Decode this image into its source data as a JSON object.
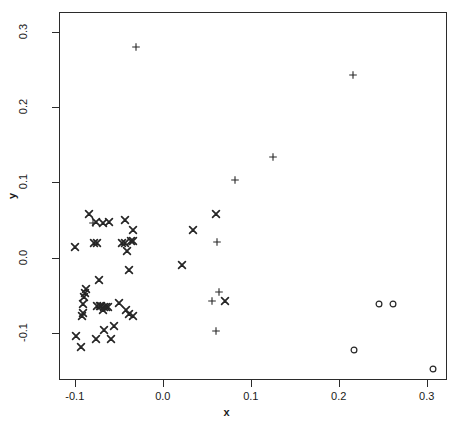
{
  "chart_data": {
    "type": "scatter",
    "title": "",
    "xlabel": "x",
    "ylabel": "y",
    "xlim": [
      -0.118,
      0.323
    ],
    "ylim": [
      -0.163,
      0.327
    ],
    "grid": false,
    "legend": "none",
    "xticks": [
      -0.1,
      0.0,
      0.1,
      0.2,
      0.3
    ],
    "xticklabels": [
      "-0.1",
      "0.0",
      "0.1",
      "0.2",
      "0.3"
    ],
    "yticks": [
      -0.1,
      0.0,
      0.1,
      0.2,
      0.3
    ],
    "yticklabels": [
      "-0.1",
      "0.0",
      "0.1",
      "0.2",
      "0.3"
    ],
    "marker_color": "#262626",
    "background": "#ffffff",
    "series": [
      {
        "name": "group-x",
        "marker": "x",
        "points": [
          [
            -0.1015,
            0.0157
          ],
          [
            -0.0855,
            0.0597
          ],
          [
            -0.0775,
            0.0483
          ],
          [
            -0.0695,
            0.047
          ],
          [
            -0.062,
            0.0483
          ],
          [
            -0.044,
            0.051
          ],
          [
            -0.0345,
            0.0375
          ],
          [
            -0.037,
            0.0235
          ],
          [
            -0.079,
            0.0213
          ],
          [
            -0.0755,
            0.0213
          ],
          [
            -0.048,
            0.0213
          ],
          [
            -0.0445,
            0.0213
          ],
          [
            -0.035,
            0.023
          ],
          [
            -0.042,
            0.0105
          ],
          [
            -0.04,
            -0.0148
          ],
          [
            0.0205,
            -0.009
          ],
          [
            0.0335,
            0.0375
          ],
          [
            0.059,
            0.06
          ],
          [
            0.069,
            -0.056
          ],
          [
            -0.074,
            -0.029
          ],
          [
            -0.088,
            -0.0405
          ],
          [
            -0.09,
            -0.046
          ],
          [
            -0.0905,
            -0.0505
          ],
          [
            -0.0915,
            -0.061
          ],
          [
            -0.092,
            -0.072
          ],
          [
            -0.0925,
            -0.076
          ],
          [
            -0.0755,
            -0.0625
          ],
          [
            -0.073,
            -0.063
          ],
          [
            -0.071,
            -0.0635
          ],
          [
            -0.0685,
            -0.064
          ],
          [
            -0.066,
            -0.0645
          ],
          [
            -0.0635,
            -0.0645
          ],
          [
            -0.0695,
            -0.069
          ],
          [
            -0.0505,
            -0.0585
          ],
          [
            -0.0435,
            -0.069
          ],
          [
            -0.0395,
            -0.0735
          ],
          [
            -0.0345,
            -0.076
          ],
          [
            -0.068,
            -0.0945
          ],
          [
            -0.0565,
            -0.09
          ],
          [
            -0.1,
            -0.1025
          ],
          [
            -0.0775,
            -0.1075
          ],
          [
            -0.094,
            -0.118
          ],
          [
            -0.06,
            -0.1075
          ]
        ]
      },
      {
        "name": "group-plus",
        "marker": "+",
        "points": [
          [
            -0.0315,
            0.282
          ],
          [
            0.2155,
            0.244
          ],
          [
            0.124,
            0.135
          ],
          [
            0.0805,
            0.1045
          ],
          [
            0.06,
            0.0225
          ],
          [
            -0.08,
            0.048
          ],
          [
            0.063,
            -0.045
          ],
          [
            0.0545,
            -0.056
          ],
          [
            0.0595,
            -0.0965
          ]
        ]
      },
      {
        "name": "group-circle",
        "marker": "o",
        "points": [
          [
            0.245,
            -0.06
          ],
          [
            0.2605,
            -0.06
          ],
          [
            0.2165,
            -0.1215
          ],
          [
            0.3055,
            -0.1475
          ]
        ]
      }
    ]
  }
}
